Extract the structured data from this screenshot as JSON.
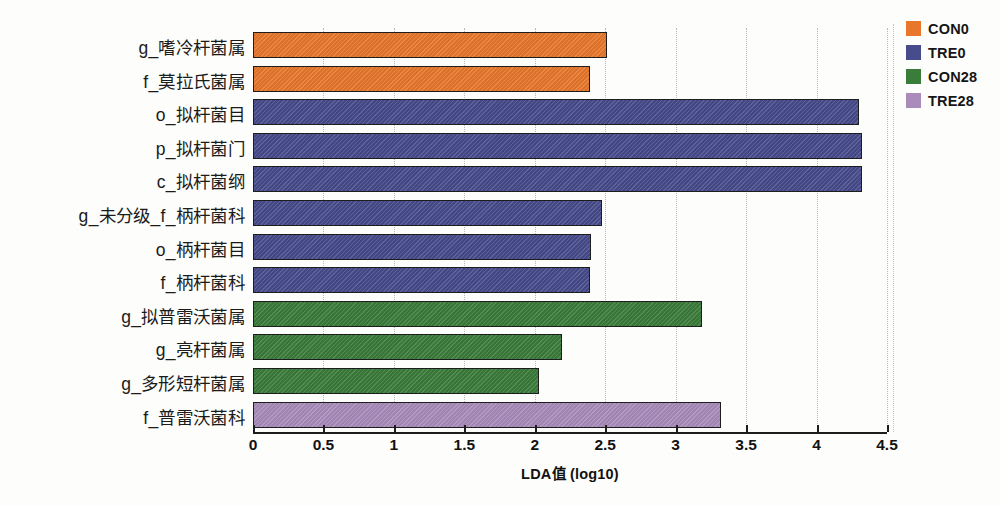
{
  "chart_data": {
    "type": "bar",
    "orientation": "horizontal",
    "title": "",
    "xlabel": "LDA值  (log10)",
    "ylabel": "",
    "xlim": [
      0,
      4.5
    ],
    "xticks": [
      0,
      0.5,
      1,
      1.5,
      2,
      2.5,
      3,
      3.5,
      4,
      4.5
    ],
    "xtick_labels": [
      "0",
      "0.5",
      "1",
      "1.5",
      "2",
      "2.5",
      "3",
      "3.5",
      "4",
      "4.5"
    ],
    "grid": "vertical-dotted",
    "legend_position": "top-right",
    "categories": [
      "g_嗜冷杆菌属",
      "f_莫拉氏菌属",
      "o_拟杆菌目",
      "p_拟杆菌门",
      "c_拟杆菌纲",
      "g_未分级_f_柄杆菌科",
      "o_柄杆菌目",
      "f_柄杆菌科",
      "g_拟普雷沃菌属",
      "g_亮杆菌属",
      "g_多形短杆菌属",
      "f_普雷沃菌科"
    ],
    "values": [
      2.51,
      2.39,
      4.3,
      4.32,
      4.32,
      2.48,
      2.4,
      2.39,
      3.19,
      2.19,
      2.03,
      3.32
    ],
    "groups": [
      "CON0",
      "CON0",
      "TRE0",
      "TRE0",
      "TRE0",
      "TRE0",
      "TRE0",
      "TRE0",
      "CON28",
      "CON28",
      "CON28",
      "TRE28"
    ],
    "series": [
      {
        "name": "CON0",
        "color": "#E8772B",
        "points": [
          {
            "category": "g_嗜冷杆菌属",
            "value": 2.51
          },
          {
            "category": "f_莫拉氏菌属",
            "value": 2.39
          }
        ]
      },
      {
        "name": "TRE0",
        "color": "#474C8C",
        "points": [
          {
            "category": "o_拟杆菌目",
            "value": 4.3
          },
          {
            "category": "p_拟杆菌门",
            "value": 4.32
          },
          {
            "category": "c_拟杆菌纲",
            "value": 4.32
          },
          {
            "category": "g_未分级_f_柄杆菌科",
            "value": 2.48
          },
          {
            "category": "o_柄杆菌目",
            "value": 2.4
          },
          {
            "category": "f_柄杆菌科",
            "value": 2.39
          }
        ]
      },
      {
        "name": "CON28",
        "color": "#3A7C3A",
        "points": [
          {
            "category": "g_拟普雷沃菌属",
            "value": 3.19
          },
          {
            "category": "g_亮杆菌属",
            "value": 2.19
          },
          {
            "category": "g_多形短杆菌属",
            "value": 2.03
          }
        ]
      },
      {
        "name": "TRE28",
        "color": "#A98CBB",
        "points": [
          {
            "category": "f_普雷沃菌科",
            "value": 3.32
          }
        ]
      }
    ]
  },
  "legend": {
    "items": [
      {
        "label": "CON0",
        "color": "#E8772B"
      },
      {
        "label": "TRE0",
        "color": "#474C8C"
      },
      {
        "label": "CON28",
        "color": "#3A7C3A"
      },
      {
        "label": "TRE28",
        "color": "#A98CBB"
      }
    ]
  },
  "axis": {
    "x_title": "LDA值  (log10)"
  }
}
